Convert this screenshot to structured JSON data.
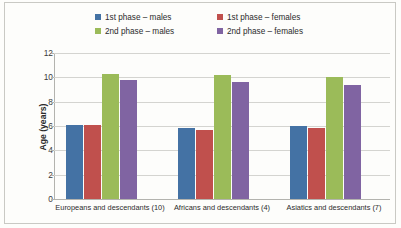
{
  "chart_data": {
    "type": "bar",
    "title": "",
    "xlabel": "",
    "ylabel": "Age (years)",
    "ylim": [
      0,
      12
    ],
    "yticks": [
      0,
      2,
      4,
      6,
      8,
      10,
      12
    ],
    "grid": true,
    "legend_position": "top",
    "categories": [
      "Europeans and descendants (10)",
      "Africans and descendants (4)",
      "Asiatics and descendants (7)"
    ],
    "series": [
      {
        "name": "1st phase – males",
        "color": "#4472a4",
        "values": [
          6.1,
          5.85,
          6.0
        ]
      },
      {
        "name": "1st phase – females",
        "color": "#c0504d",
        "values": [
          6.1,
          5.7,
          5.8
        ]
      },
      {
        "name": "2nd phase – males",
        "color": "#9bbb59",
        "values": [
          10.3,
          10.2,
          10.0
        ]
      },
      {
        "name": "2nd phase – females",
        "color": "#8064a2",
        "values": [
          9.75,
          9.6,
          9.35
        ]
      }
    ]
  },
  "colors": {
    "plot_background": "#fdfdfb",
    "grid_line": "#d4d4d0",
    "axis_line": "#b3b3ae",
    "border": "#c9c9c4",
    "text": "#2b2b2b"
  }
}
